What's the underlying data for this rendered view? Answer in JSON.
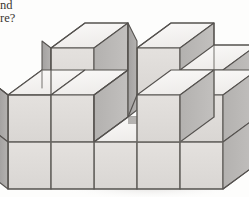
{
  "page": {
    "background_color": "#fdfdfc",
    "width": 249,
    "height": 197
  },
  "question_text": {
    "line1": "nd",
    "line2": "re?",
    "note_color": "#3a3632"
  },
  "figure": {
    "colors": {
      "top_face": "#f3f1ef",
      "front_face": "#dedbd8",
      "side_face": "#b9b7b5",
      "side_face_dark": "#a9a7a5",
      "outline": "#55524f",
      "inner_line": "#6e6b68",
      "shadow": "#e6e4e2"
    },
    "projection": {
      "type": "isometric",
      "cube_width_px": 43,
      "cube_height_px": 47,
      "depth_dx_px": 34,
      "depth_dy_px": -25,
      "origin_x_px": 8,
      "origin_y_px": 190
    },
    "grid": {
      "columns": 5,
      "rows": 2,
      "max_levels": 3
    },
    "heights": [
      [
        3,
        2,
        1,
        3,
        2
      ],
      [
        2,
        2,
        1,
        2,
        2
      ]
    ],
    "cube_count_visible": 21
  }
}
